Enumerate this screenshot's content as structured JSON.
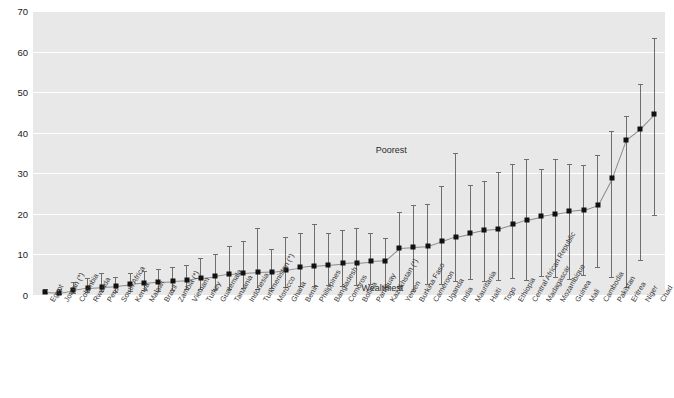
{
  "chart_data": {
    "type": "scatter",
    "title": "",
    "subtitle": "",
    "xlabel": "",
    "ylabel": "",
    "ylim": [
      0,
      70
    ],
    "yticks": [
      0,
      10,
      20,
      30,
      40,
      50,
      60,
      70
    ],
    "grid": true,
    "legend_position": "none",
    "marker_style": "filled-square",
    "errorbar_meaning": "range from wealthiest quintile (lower cap) to poorest quintile (upper cap)",
    "annotations": [
      {
        "text": "Poorest",
        "x_category": "Cameroon",
        "value": 35.0,
        "placement": "above-upper-cap"
      },
      {
        "text": "Wealthiest",
        "x_category": "Burkina Faso",
        "value": 1.0,
        "placement": "below-lower-cap"
      }
    ],
    "categories": [
      "Egypt",
      "Jordan (*)",
      "Colombia",
      "Rwanda",
      "Peru",
      "South Africa",
      "Kenya",
      "Malawi",
      "Brazil",
      "Zambia (*)",
      "Vietnam",
      "Turkey",
      "Guatemala",
      "Tanzania",
      "Indonesia",
      "Turkmenistan (*)",
      "Morocco",
      "Ghana",
      "Benin",
      "Philippines",
      "Bangladesh",
      "Comoros",
      "Bolivia",
      "Paraguay",
      "Kazakhstan (*)",
      "Yemen",
      "Burkina Faso",
      "Cameroon",
      "Uganda",
      "India",
      "Mauritania",
      "Haiti",
      "Togo",
      "Ethiopia",
      "Central African Republic",
      "Madagascar",
      "Mozambique",
      "Guinea",
      "Mali",
      "Cambodia",
      "Pakistan",
      "Eritrea",
      "Niger",
      "Chad"
    ],
    "values": [
      0.8,
      0.6,
      1.2,
      1.8,
      2.0,
      2.2,
      2.6,
      3.0,
      3.3,
      3.4,
      3.6,
      4.3,
      4.6,
      5.2,
      5.4,
      5.6,
      5.7,
      6.2,
      6.8,
      7.2,
      7.5,
      7.8,
      8.0,
      8.3,
      8.5,
      11.6,
      11.8,
      12.0,
      13.2,
      14.4,
      15.2,
      16.0,
      16.3,
      17.4,
      18.6,
      19.4,
      20.0,
      20.6,
      21.0,
      22.2,
      28.8,
      38.3,
      41.0,
      44.6
    ],
    "lower": [
      0.4,
      0.3,
      0.6,
      0.8,
      0.9,
      0.8,
      1.0,
      1.2,
      1.1,
      1.2,
      1.5,
      1.6,
      1.5,
      1.4,
      1.7,
      1.6,
      1.8,
      2.0,
      2.1,
      2.2,
      2.4,
      2.3,
      2.4,
      2.6,
      2.0,
      2.2,
      0.9,
      2.6,
      2.7,
      3.4,
      4.0,
      3.4,
      3.8,
      4.2,
      3.6,
      4.6,
      4.4,
      4.0,
      5.0,
      6.8,
      4.4,
      2.0,
      8.6,
      19.8
    ],
    "upper": [
      1.6,
      1.4,
      3.3,
      4.1,
      5.4,
      4.5,
      5.3,
      6.0,
      6.5,
      7.0,
      7.3,
      9.0,
      10.0,
      12.0,
      13.2,
      16.4,
      11.4,
      14.4,
      15.2,
      17.4,
      15.2,
      16.0,
      16.4,
      15.2,
      14.0,
      20.4,
      22.2,
      22.4,
      26.8,
      35.0,
      27.2,
      28.0,
      30.2,
      32.4,
      33.6,
      31.0,
      33.4,
      32.2,
      32.0,
      34.6,
      40.4,
      44.2,
      52.0,
      63.4
    ]
  },
  "colors": {
    "plot_background": "#e8e8e8",
    "page_background": "#ffffff",
    "gridline": "#ffffff",
    "marker": "#111111",
    "whisker": "#6e6e6e",
    "connector": "#8a8a8a",
    "axis_text": "#1a1a1a",
    "category_text": "#3a3a3a"
  }
}
